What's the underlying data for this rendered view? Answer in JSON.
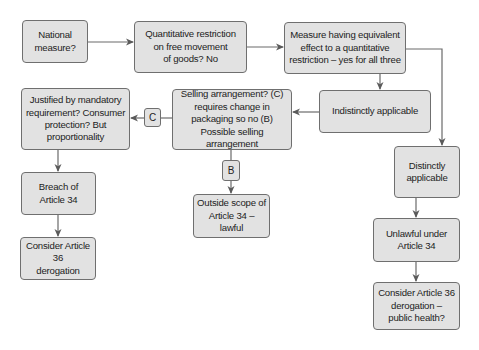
{
  "diagram": {
    "nodes": {
      "national": {
        "lines": [
          "National",
          "measure?"
        ]
      },
      "quantitative": {
        "lines": [
          "Quantitative restriction",
          "on free movement",
          "of goods? No"
        ]
      },
      "meqr": {
        "lines": [
          "Measure having equivalent",
          "effect to a quantitative",
          "restriction – yes for all three"
        ]
      },
      "indistinct": {
        "lines": [
          "Indistinctly applicable"
        ]
      },
      "selling": {
        "lines": [
          "Selling arrangement? (C)",
          "requires change in",
          "packaging so no (B)",
          "Possible selling arrangement"
        ]
      },
      "justified": {
        "lines": [
          "Justified by mandatory",
          "requirement? Consumer",
          "protection? But",
          "proportionality"
        ]
      },
      "breach": {
        "lines": [
          "Breach of",
          "Article 34"
        ]
      },
      "derog_left": {
        "lines": [
          "Consider Article 36",
          "derogation"
        ]
      },
      "outside": {
        "lines": [
          "Outside scope of",
          "Article 34 – lawful"
        ]
      },
      "distinct": {
        "lines": [
          "Distinctly",
          "applicable"
        ]
      },
      "unlawful": {
        "lines": [
          "Unlawful under",
          "Article 34"
        ]
      },
      "derog_right": {
        "lines": [
          "Consider Article 36",
          "derogation –",
          "public health?"
        ]
      }
    },
    "tags": {
      "c": "C",
      "b": "B"
    },
    "colors": {
      "box_fill": "#e2e2e2",
      "box_border": "#6f6f6f",
      "connector": "#6a6a6a"
    }
  }
}
